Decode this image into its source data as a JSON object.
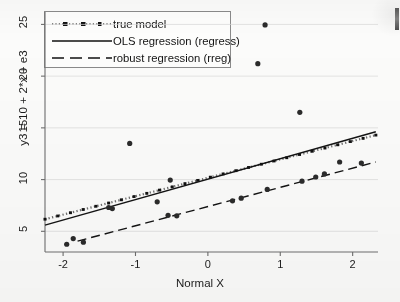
{
  "chart_data": {
    "type": "scatter",
    "title": "",
    "xlabel": "Normal X",
    "ylabel": "y3 = 10 + 2*x + e3",
    "xlim": [
      -2.25,
      2.35
    ],
    "ylim": [
      3.0,
      26.2
    ],
    "xticks": [
      -2,
      -1,
      0,
      1,
      2
    ],
    "xticklabels": [
      "-2",
      "-1",
      "0",
      "1",
      "2"
    ],
    "yticks": [
      5,
      10,
      15,
      20,
      25
    ],
    "yticklabels": [
      "5",
      "10",
      "15",
      "20",
      "25"
    ],
    "grid": "horizontal-faint",
    "legend_position": "upper-left",
    "legend": [
      {
        "label": "true model",
        "style": "dotted"
      },
      {
        "label": "OLS regression (regress)",
        "style": "solid"
      },
      {
        "label": "robust regression (rreg)",
        "style": "dashed"
      }
    ],
    "points": [
      {
        "x": -1.95,
        "y": 3.75
      },
      {
        "x": -1.86,
        "y": 4.3
      },
      {
        "x": -1.72,
        "y": 3.95
      },
      {
        "x": -1.37,
        "y": 7.3
      },
      {
        "x": -1.32,
        "y": 7.2
      },
      {
        "x": -1.08,
        "y": 13.5
      },
      {
        "x": -0.7,
        "y": 7.85
      },
      {
        "x": -0.55,
        "y": 6.55
      },
      {
        "x": -0.52,
        "y": 9.95
      },
      {
        "x": -0.43,
        "y": 6.5
      },
      {
        "x": 0.34,
        "y": 7.95
      },
      {
        "x": 0.46,
        "y": 8.2
      },
      {
        "x": 0.69,
        "y": 21.2
      },
      {
        "x": 0.79,
        "y": 24.95
      },
      {
        "x": 0.82,
        "y": 9.05
      },
      {
        "x": 1.27,
        "y": 16.5
      },
      {
        "x": 1.3,
        "y": 9.85
      },
      {
        "x": 1.49,
        "y": 10.25
      },
      {
        "x": 1.61,
        "y": 10.55
      },
      {
        "x": 1.82,
        "y": 11.7
      },
      {
        "x": 2.12,
        "y": 11.6
      }
    ],
    "series": [
      {
        "name": "true model",
        "style": "dotted",
        "line": {
          "intercept": 10.12,
          "slope": 1.02
        },
        "endpoints": [
          {
            "x": -2.25,
            "y": 6.17
          },
          {
            "x": 2.32,
            "y": 14.3
          }
        ]
      },
      {
        "name": "OLS regression (regress)",
        "style": "solid",
        "line": {
          "intercept": 10.05,
          "slope": 1.09
        },
        "endpoints": [
          {
            "x": -2.25,
            "y": 5.6
          },
          {
            "x": 2.32,
            "y": 14.62
          }
        ]
      },
      {
        "name": "robust regression (rreg)",
        "style": "dashed",
        "line": {
          "intercept": 8.18,
          "slope": 0.85
        },
        "endpoints": [
          {
            "x": -1.8,
            "y": 4.05
          },
          {
            "x": 2.32,
            "y": 11.7
          }
        ]
      }
    ]
  }
}
